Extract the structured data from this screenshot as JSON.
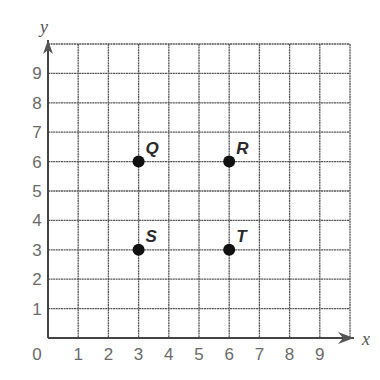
{
  "chart_data": {
    "type": "scatter",
    "title": "",
    "xlabel": "x",
    "ylabel": "y",
    "xlim": [
      0,
      10
    ],
    "ylim": [
      0,
      10
    ],
    "grid": true,
    "x_ticks": [
      "0",
      "1",
      "2",
      "3",
      "4",
      "5",
      "6",
      "7",
      "8",
      "9"
    ],
    "y_ticks": [
      "1",
      "2",
      "3",
      "4",
      "5",
      "6",
      "7",
      "8",
      "9"
    ],
    "points": [
      {
        "label": "Q",
        "x": 3,
        "y": 6
      },
      {
        "label": "R",
        "x": 6,
        "y": 6
      },
      {
        "label": "S",
        "x": 3,
        "y": 3
      },
      {
        "label": "T",
        "x": 6,
        "y": 3
      }
    ]
  },
  "colors": {
    "grid": "#555555",
    "point": "#111111",
    "tick_text": "#6a6a6a"
  }
}
